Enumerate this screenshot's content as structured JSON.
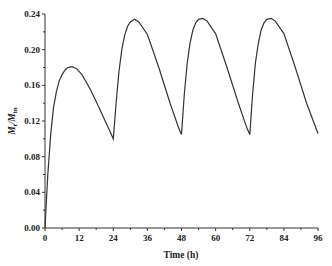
{
  "chart_data": {
    "type": "line",
    "title": "",
    "xlabel": "Time (h)",
    "ylabel": "Mt/Min",
    "ylabel_main": "M",
    "ylabel_sub1": "t",
    "ylabel_mid": "/M",
    "ylabel_sub2": "in",
    "xlim": [
      0,
      96
    ],
    "ylim": [
      0,
      0.24
    ],
    "xticks": [
      "0",
      "12",
      "24",
      "36",
      "48",
      "60",
      "72",
      "84",
      "96"
    ],
    "yticks": [
      "0.00",
      "0.04",
      "0.08",
      "0.12",
      "0.16",
      "0.20",
      "0.24"
    ],
    "grid": false,
    "legend": null,
    "series": [
      {
        "name": "Mt/Min",
        "x": [
          0,
          1,
          2,
          3,
          4,
          5,
          6,
          7,
          8,
          9.5,
          11,
          13,
          16,
          19,
          22,
          24,
          25,
          26,
          27,
          28,
          29,
          30,
          31.5,
          33,
          36,
          40,
          44,
          47,
          48,
          49,
          50,
          51,
          52,
          53,
          54,
          55.5,
          57,
          60,
          64,
          68,
          71,
          72,
          73,
          74,
          75,
          76,
          77,
          78,
          79.5,
          81,
          84,
          88,
          92,
          96
        ],
        "y": [
          0,
          0.06,
          0.105,
          0.135,
          0.153,
          0.165,
          0.172,
          0.177,
          0.18,
          0.181,
          0.179,
          0.172,
          0.155,
          0.135,
          0.114,
          0.1,
          0.14,
          0.175,
          0.2,
          0.216,
          0.226,
          0.231,
          0.234,
          0.231,
          0.217,
          0.18,
          0.14,
          0.112,
          0.105,
          0.15,
          0.185,
          0.207,
          0.222,
          0.23,
          0.234,
          0.235,
          0.232,
          0.218,
          0.18,
          0.14,
          0.112,
          0.105,
          0.15,
          0.185,
          0.207,
          0.222,
          0.23,
          0.234,
          0.235,
          0.232,
          0.218,
          0.18,
          0.14,
          0.106
        ]
      }
    ]
  }
}
